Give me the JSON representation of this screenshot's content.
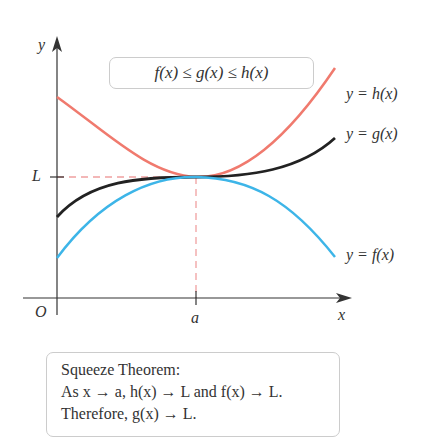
{
  "diagram": {
    "axes": {
      "y_label": "y",
      "x_label": "x",
      "origin_label": "O",
      "limit_label": "L",
      "point_label": "a"
    },
    "inequality": "f(x) ≤ g(x) ≤ h(x)",
    "curve_labels": {
      "h": "y = h(x)",
      "g": "y = g(x)",
      "f": "y = f(x)"
    },
    "colors": {
      "h": "#f07a6e",
      "g": "#222222",
      "f": "#3db5e8",
      "guide": "#f0a0a0",
      "axis": "#333333"
    },
    "theorem": {
      "title": "Squeeze Theorem:",
      "line1": "As x → a, h(x) → L and f(x) → L.",
      "line2": "Therefore, g(x) → L."
    }
  }
}
